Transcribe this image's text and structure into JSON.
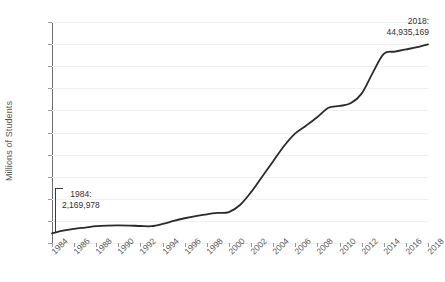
{
  "chart_data": {
    "type": "line",
    "title": "",
    "xlabel": "",
    "ylabel": "Millions of Students",
    "xlim": [
      1984,
      2018
    ],
    "ylim": [
      0,
      50
    ],
    "grid": true,
    "legend": "none",
    "y_ticks": [
      0,
      5,
      10,
      15,
      20,
      25,
      30,
      35,
      40,
      45,
      50
    ],
    "x_ticks": [
      1984,
      1986,
      1988,
      1990,
      1992,
      1994,
      1996,
      1998,
      2000,
      2002,
      2004,
      2006,
      2008,
      2010,
      2012,
      2014,
      2016,
      2018
    ],
    "series": [
      {
        "name": "Millions of Students",
        "x": [
          1984,
          1985,
          1986,
          1987,
          1988,
          1989,
          1990,
          1991,
          1992,
          1993,
          1994,
          1995,
          1996,
          1997,
          1998,
          1999,
          2000,
          2001,
          2002,
          2003,
          2004,
          2005,
          2006,
          2007,
          2008,
          2009,
          2010,
          2011,
          2012,
          2013,
          2014,
          2015,
          2016,
          2017,
          2018
        ],
        "values": [
          2.17,
          2.8,
          3.2,
          3.5,
          3.8,
          3.95,
          4.0,
          3.95,
          3.85,
          3.8,
          4.3,
          5.0,
          5.6,
          6.1,
          6.5,
          6.8,
          7.0,
          8.6,
          11.5,
          15.0,
          18.5,
          22.0,
          24.8,
          26.6,
          28.5,
          30.6,
          31.0,
          31.6,
          33.8,
          38.5,
          42.8,
          43.3,
          43.8,
          44.3,
          44.94
        ]
      }
    ],
    "annotations": [
      {
        "name": "start-point",
        "year_label": "1984:",
        "value_label": "2,169,978",
        "x": 1984,
        "y": 2.17
      },
      {
        "name": "end-point",
        "year_label": "2018:",
        "value_label": "44,935,169",
        "x": 2018,
        "y": 44.94
      }
    ],
    "colors": {
      "line": "#2b2b2b",
      "grid": "#f1f1f1",
      "axis": "#6f7072",
      "text": "#58595b",
      "annotation_text": "#2f3031",
      "background": "#ffffff"
    }
  }
}
